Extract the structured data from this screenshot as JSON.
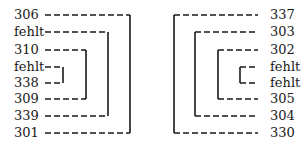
{
  "diagram": {
    "left": {
      "labels": [
        "306",
        "fehlt",
        "310",
        "fehlt",
        "338",
        "309",
        "339",
        "301"
      ],
      "pairs": [
        [
          "306",
          "301"
        ],
        [
          "fehlt",
          "339"
        ],
        [
          "310",
          "309"
        ],
        [
          "fehlt",
          "338"
        ]
      ]
    },
    "right": {
      "labels": [
        "337",
        "303",
        "302",
        "fehlt",
        "fehlt",
        "305",
        "304",
        "330"
      ],
      "pairs": [
        [
          "337",
          "330"
        ],
        [
          "303",
          "304"
        ],
        [
          "302",
          "305"
        ],
        [
          "fehlt",
          "fehlt"
        ]
      ]
    },
    "line_color": "#1a1a1a"
  }
}
